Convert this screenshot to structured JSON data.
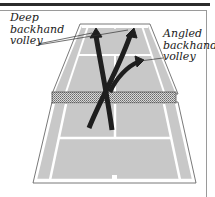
{
  "figure": {
    "labels": {
      "deep": [
        "Deep",
        "backhand",
        "volley"
      ],
      "angled": [
        "Angled",
        "backhand",
        "volley"
      ]
    },
    "colors": {
      "court_fill": "#c8c8c8",
      "court_lines": "#ffffff",
      "arrow": "#1e1e1e",
      "net": "#8a8a8a",
      "outline": "#555555",
      "top_rule": "#2b2b2b"
    },
    "shots": [
      {
        "name": "deep backhand volley (left)",
        "from": "net-center",
        "to": "far-baseline-left"
      },
      {
        "name": "deep backhand volley (right)",
        "from": "net-center",
        "to": "far-baseline-right"
      },
      {
        "name": "angled backhand volley",
        "from": "net-center",
        "to": "far-service-box-right-sideline"
      }
    ]
  }
}
